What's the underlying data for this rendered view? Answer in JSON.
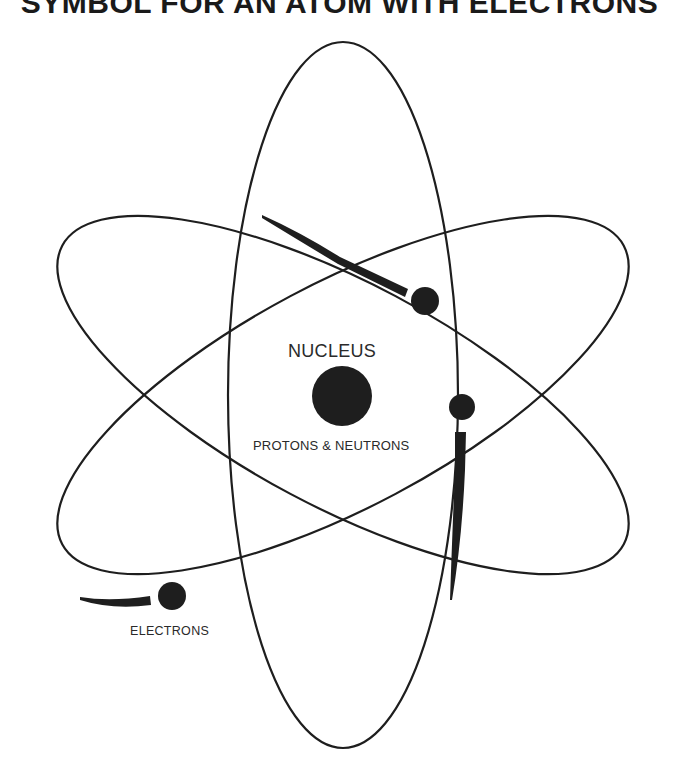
{
  "title": "SYMBOL FOR AN ATOM WITH ELECTRONS",
  "labels": {
    "nucleus": "NUCLEUS",
    "protons_neutrons": "PROTONS & NEUTRONS",
    "electrons": "ELECTRONS"
  },
  "colors": {
    "ink": "#1e1e1e",
    "background": "#ffffff"
  },
  "diagram": {
    "center": [
      343,
      395
    ],
    "orbits": [
      {
        "name": "vertical-orbit",
        "rx": 115,
        "ry": 353,
        "rotation": 0
      },
      {
        "name": "tilted-orbit-a",
        "rx": 318,
        "ry": 112,
        "rotation": 28
      },
      {
        "name": "tilted-orbit-b",
        "rx": 318,
        "ry": 112,
        "rotation": -28
      }
    ],
    "nucleus": {
      "cx": 342,
      "cy": 396,
      "r": 30
    },
    "electrons": [
      {
        "cx": 425,
        "cy": 301,
        "r": 14
      },
      {
        "cx": 462,
        "cy": 407,
        "r": 13
      },
      {
        "cx": 172,
        "cy": 596,
        "r": 14
      }
    ]
  }
}
